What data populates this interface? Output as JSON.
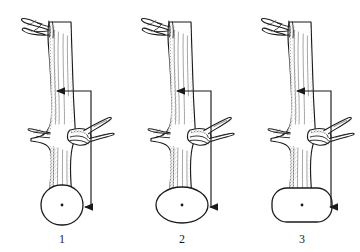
{
  "figure": {
    "background_color": "#ffffff",
    "ink_color": "#1a1a1a",
    "width": 360,
    "height": 252
  },
  "panels": [
    {
      "id": "panel-1",
      "caption": "1",
      "caption_x": 62,
      "caption_y": 243,
      "trunk_center_x": 62,
      "section": {
        "shape": "circle",
        "cx": 62,
        "cy": 205,
        "rx": 21,
        "ry": 20,
        "corner": 20,
        "dot_r": 1.4
      },
      "connector": {
        "vertical_x": 91,
        "top_y": 91,
        "bottom_y": 207,
        "top_arrow_tip_x": 57,
        "bottom_arrow_tip_x": 85
      },
      "branch_stub": {
        "junction_x": 66,
        "junction_y": 134,
        "angle_label": "steep"
      }
    },
    {
      "id": "panel-2",
      "caption": "2",
      "caption_x": 182,
      "caption_y": 243,
      "trunk_center_x": 182,
      "section": {
        "shape": "ellipse",
        "cx": 182,
        "cy": 205,
        "rx": 26,
        "ry": 18,
        "corner": 18,
        "dot_r": 1.4
      },
      "connector": {
        "vertical_x": 211,
        "top_y": 91,
        "bottom_y": 207,
        "top_arrow_tip_x": 177,
        "bottom_arrow_tip_x": 210
      },
      "branch_stub": {
        "junction_x": 186,
        "junction_y": 134,
        "angle_label": "moderate"
      }
    },
    {
      "id": "panel-3",
      "caption": "3",
      "caption_x": 302,
      "caption_y": 243,
      "trunk_center_x": 302,
      "section": {
        "shape": "rounded-ellipse",
        "cx": 302,
        "cy": 205,
        "rx": 30,
        "ry": 17,
        "corner": 15,
        "dot_r": 1.4
      },
      "connector": {
        "vertical_x": 331,
        "top_y": 91,
        "bottom_y": 207,
        "top_arrow_tip_x": 297,
        "bottom_arrow_tip_x": 330
      },
      "branch_stub": {
        "junction_x": 306,
        "junction_y": 134,
        "angle_label": "shallow"
      }
    }
  ],
  "annotations": {
    "arrow_direction": "left",
    "arrow_count": 6,
    "connector_style": "right-angle bracket"
  }
}
